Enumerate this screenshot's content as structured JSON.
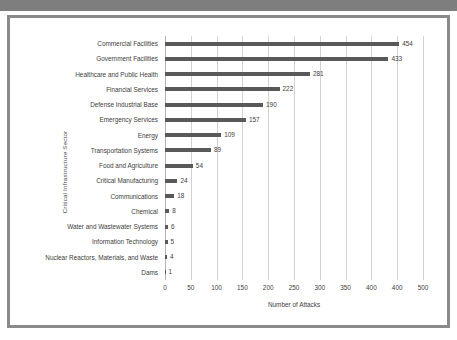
{
  "chart_data": {
    "type": "bar",
    "orientation": "horizontal",
    "title": "",
    "xlabel": "Number of Attacks",
    "ylabel": "Critical Infrastructure Sector",
    "categories": [
      "Commercial Facilities",
      "Government Facilities",
      "Healthcare and Public Health",
      "Financial Services",
      "Defense Industrial Base",
      "Emergency Services",
      "Energy",
      "Transportation Systems",
      "Food and Agriculture",
      "Critical Manufacturing",
      "Communications",
      "Chemical",
      "Water and Wastewater Systems",
      "Information Technology",
      "Nuclear Reactors, Materials, and Waste",
      "Dams"
    ],
    "values": [
      454,
      433,
      281,
      222,
      190,
      157,
      109,
      89,
      54,
      24,
      18,
      8,
      6,
      5,
      4,
      1
    ],
    "value_labels": [
      "454",
      "433",
      "281",
      "222",
      "190",
      "157",
      "109",
      "89",
      "54",
      "24",
      "18",
      "8",
      "6",
      "5",
      "4",
      "1"
    ],
    "xlim": [
      0,
      500
    ],
    "xticks": [
      0,
      50,
      100,
      150,
      200,
      250,
      300,
      350,
      400,
      450,
      500
    ],
    "xtick_labels": [
      "0",
      "50",
      "100",
      "150",
      "200",
      "250",
      "300",
      "350",
      "400",
      "400",
      "500"
    ],
    "grid": "vertical",
    "legend": "none",
    "bar_color": "#595959",
    "gridline_color": "#d2d2d2",
    "frame_color": "#8a8a8a",
    "text_color": "#3d3d3d"
  }
}
